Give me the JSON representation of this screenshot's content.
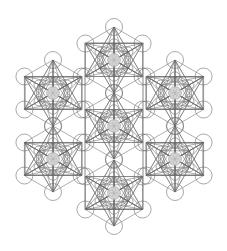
{
  "figure": {
    "title": "Metatron's Cube cluster",
    "colors": {
      "background": "#ffffff",
      "line": "#6a6a6a",
      "core_fill": "#d6d6d6"
    },
    "unit_radius": 33,
    "node_circle_radius": 8.5,
    "inner_circle_radius": 8.5,
    "core_radius": 6.5,
    "units": [
      {
        "name": "top",
        "cx": 114,
        "cy": 60
      },
      {
        "name": "upper-left",
        "cx": 53,
        "cy": 93
      },
      {
        "name": "upper-right",
        "cx": 175,
        "cy": 93
      },
      {
        "name": "center",
        "cx": 114,
        "cy": 126
      },
      {
        "name": "lower-left",
        "cx": 53,
        "cy": 159
      },
      {
        "name": "lower-right",
        "cx": 175,
        "cy": 159
      },
      {
        "name": "bottom",
        "cx": 114,
        "cy": 193
      }
    ],
    "frames": [
      {
        "name": "central-column",
        "x": 85,
        "y": 43,
        "w": 58,
        "h": 166
      },
      {
        "name": "left-upper-box",
        "x": 25,
        "y": 77,
        "w": 57,
        "h": 32
      },
      {
        "name": "left-lower-box",
        "x": 25,
        "y": 143,
        "w": 57,
        "h": 32
      },
      {
        "name": "right-upper-box",
        "x": 146,
        "y": 77,
        "w": 57,
        "h": 32
      },
      {
        "name": "right-lower-box",
        "x": 146,
        "y": 143,
        "w": 57,
        "h": 32
      }
    ]
  }
}
